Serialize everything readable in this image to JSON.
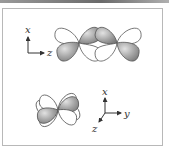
{
  "figure": {
    "top_axes": {
      "vertical_label": "x",
      "horizontal_label": "z"
    },
    "bottom_axes": {
      "vertical_label": "x",
      "horizontal_label": "y",
      "depth_label": "z"
    },
    "colors": {
      "shaded_lobe": "#9a9a9a",
      "shaded_lobe_highlight": "#d8d8d8",
      "unshaded_lobe": "#ffffff",
      "outline": "#555555",
      "frame_border": "#b8b8b8"
    }
  }
}
